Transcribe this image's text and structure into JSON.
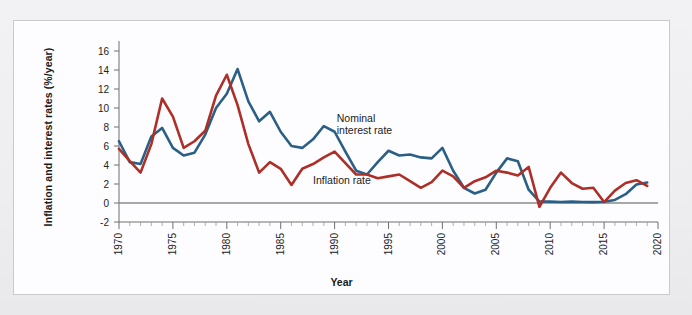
{
  "figure": {
    "panel_background": "#fdfdff",
    "page_background": "#eeeef0",
    "border_color": "#c9c9cf"
  },
  "annotations": {
    "nominal_label": "Nominal\ninterest rate",
    "inflation_label": "Inflation rate"
  },
  "chart_data": {
    "type": "line",
    "title": "",
    "xlabel": "Year",
    "ylabel": "Inflation and interest rates (%/year)",
    "xlim": [
      1970,
      2020
    ],
    "ylim": [
      -2,
      16
    ],
    "yticks": [
      -2,
      0,
      2,
      4,
      6,
      8,
      10,
      12,
      14,
      16
    ],
    "ytick_labels": [
      "-2",
      "0",
      "2",
      "4",
      "6",
      "8",
      "10",
      "12",
      "14",
      "16"
    ],
    "xticks": [
      1970,
      1975,
      1980,
      1985,
      1990,
      1995,
      2000,
      2005,
      2010,
      2015,
      2020
    ],
    "xtick_labels": [
      "1970",
      "1975",
      "1980",
      "1985",
      "1990",
      "1995",
      "2000",
      "2005",
      "2010",
      "2015",
      "2020"
    ],
    "minor_xticks": [
      1971,
      1972,
      1973,
      1974,
      1976,
      1977,
      1978,
      1979,
      1981,
      1982,
      1983,
      1984,
      1986,
      1987,
      1988,
      1989,
      1991,
      1992,
      1993,
      1994,
      1996,
      1997,
      1998,
      1999,
      2001,
      2002,
      2003,
      2004,
      2006,
      2007,
      2008,
      2009,
      2011,
      2012,
      2013,
      2014,
      2016,
      2017,
      2018,
      2019
    ],
    "grid": false,
    "legend_position": "inline-annotations",
    "zero_line": true,
    "zero_line_color": "#8a8a8a",
    "x": [
      1970,
      1971,
      1972,
      1973,
      1974,
      1975,
      1976,
      1977,
      1978,
      1979,
      1980,
      1981,
      1982,
      1983,
      1984,
      1985,
      1986,
      1987,
      1988,
      1989,
      1990,
      1991,
      1992,
      1993,
      1994,
      1995,
      1996,
      1997,
      1998,
      1999,
      2000,
      2001,
      2002,
      2003,
      2004,
      2005,
      2006,
      2007,
      2008,
      2009,
      2010,
      2011,
      2012,
      2013,
      2014,
      2015,
      2016,
      2017,
      2018,
      2019
    ],
    "series": [
      {
        "name": "Nominal interest rate",
        "color": "#2b5f86",
        "values": [
          6.5,
          4.3,
          4.1,
          7.0,
          7.9,
          5.8,
          5.0,
          5.3,
          7.2,
          10.0,
          11.5,
          14.1,
          10.7,
          8.6,
          9.6,
          7.5,
          6.0,
          5.8,
          6.7,
          8.1,
          7.5,
          5.4,
          3.4,
          3.0,
          4.3,
          5.5,
          5.0,
          5.1,
          4.8,
          4.7,
          5.8,
          3.4,
          1.6,
          1.0,
          1.4,
          3.2,
          4.7,
          4.4,
          1.4,
          0.15,
          0.14,
          0.1,
          0.14,
          0.11,
          0.09,
          0.13,
          0.32,
          0.93,
          1.94,
          2.16
        ]
      },
      {
        "name": "Inflation rate",
        "color": "#ad2f27",
        "values": [
          5.7,
          4.4,
          3.2,
          6.2,
          11.0,
          9.1,
          5.8,
          6.5,
          7.6,
          11.3,
          13.5,
          10.3,
          6.2,
          3.2,
          4.3,
          3.6,
          1.9,
          3.6,
          4.1,
          4.8,
          5.4,
          4.2,
          3.0,
          3.0,
          2.6,
          2.8,
          3.0,
          2.3,
          1.6,
          2.2,
          3.4,
          2.8,
          1.6,
          2.3,
          2.7,
          3.4,
          3.2,
          2.9,
          3.8,
          -0.4,
          1.6,
          3.2,
          2.1,
          1.5,
          1.6,
          0.1,
          1.3,
          2.1,
          2.4,
          1.8
        ]
      }
    ]
  }
}
